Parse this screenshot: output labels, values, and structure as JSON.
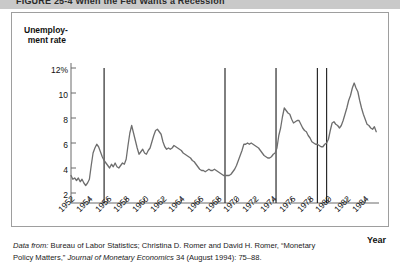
{
  "figure": {
    "title_band_text": "FIGURE 25-4   When the Fed Wants a Recession",
    "source_note_lead": "Data from:",
    "source_note_part1": " Bureau of Labor Statistics; Christina D. Romer and David H. Romer, “Monetary",
    "source_note_part2": "Policy Matters,” ",
    "source_note_journal": "Journal of Monetary Economics",
    "source_note_part3": " 34 (August 1994): 75–88."
  },
  "chart_data": {
    "type": "line",
    "title": "When the Fed Wants a Recession",
    "xlabel": "Year",
    "ylabel_line1": "Unemploy-",
    "ylabel_line2": "ment rate",
    "xlim": [
      1952,
      1985.5
    ],
    "ylim": [
      1.2,
      12.6
    ],
    "grid": false,
    "legend": "none",
    "ytick_labels": [
      "12%",
      "10",
      "8",
      "6",
      "4",
      "2"
    ],
    "ytick_values": [
      12,
      10,
      8,
      6,
      4,
      2
    ],
    "xtick_labels": [
      "1952",
      "1954",
      "1956",
      "1958",
      "1960",
      "1962",
      "1964",
      "1966",
      "1968",
      "1970",
      "1972",
      "1974",
      "1976",
      "1978",
      "1980",
      "1982",
      "1984"
    ],
    "xtick_values": [
      1952,
      1954,
      1956,
      1958,
      1960,
      1962,
      1964,
      1966,
      1968,
      1970,
      1972,
      1974,
      1976,
      1978,
      1980,
      1982,
      1984
    ],
    "line_color": "#6e6e6e",
    "marker_line_color": "#2b2b2b",
    "annotations": [
      {
        "name": "romer-date-1955",
        "x": 1955.6
      },
      {
        "name": "romer-date-1968",
        "x": 1968.75
      },
      {
        "name": "romer-date-1974",
        "x": 1974.3
      },
      {
        "name": "romer-date-1979",
        "x": 1978.8
      },
      {
        "name": "romer-date-1980",
        "x": 1979.8
      }
    ],
    "series": [
      {
        "name": "Unemployment rate",
        "x": [
          1952.0,
          1952.2,
          1952.4,
          1952.6,
          1952.8,
          1953.0,
          1953.2,
          1953.4,
          1953.6,
          1953.8,
          1954.0,
          1954.2,
          1954.4,
          1954.6,
          1954.8,
          1955.0,
          1955.2,
          1955.4,
          1955.6,
          1955.8,
          1956.0,
          1956.2,
          1956.4,
          1956.6,
          1956.8,
          1957.0,
          1957.2,
          1957.4,
          1957.6,
          1957.8,
          1958.0,
          1958.2,
          1958.4,
          1958.6,
          1958.8,
          1959.0,
          1959.2,
          1959.4,
          1959.6,
          1959.8,
          1960.0,
          1960.2,
          1960.4,
          1960.6,
          1960.8,
          1961.0,
          1961.2,
          1961.4,
          1961.6,
          1961.8,
          1962.0,
          1962.2,
          1962.4,
          1962.6,
          1962.8,
          1963.0,
          1963.2,
          1963.4,
          1963.6,
          1963.8,
          1964.0,
          1964.2,
          1964.4,
          1964.6,
          1964.8,
          1965.0,
          1965.2,
          1965.4,
          1965.6,
          1965.8,
          1966.0,
          1966.2,
          1966.4,
          1966.6,
          1966.8,
          1967.0,
          1967.2,
          1967.4,
          1967.6,
          1967.8,
          1968.0,
          1968.2,
          1968.4,
          1968.6,
          1968.8,
          1969.0,
          1969.2,
          1969.4,
          1969.6,
          1969.8,
          1970.0,
          1970.2,
          1970.4,
          1970.6,
          1970.8,
          1971.0,
          1971.2,
          1971.4,
          1971.6,
          1971.8,
          1972.0,
          1972.2,
          1972.4,
          1972.6,
          1972.8,
          1973.0,
          1973.2,
          1973.4,
          1973.6,
          1973.8,
          1974.0,
          1974.2,
          1974.4,
          1974.6,
          1974.8,
          1975.0,
          1975.2,
          1975.4,
          1975.6,
          1975.8,
          1976.0,
          1976.2,
          1976.4,
          1976.6,
          1976.8,
          1977.0,
          1977.2,
          1977.4,
          1977.6,
          1977.8,
          1978.0,
          1978.2,
          1978.4,
          1978.6,
          1978.8,
          1979.0,
          1979.2,
          1979.4,
          1979.6,
          1979.8,
          1980.0,
          1980.2,
          1980.4,
          1980.6,
          1980.8,
          1981.0,
          1981.2,
          1981.4,
          1981.6,
          1981.8,
          1982.0,
          1982.2,
          1982.4,
          1982.6,
          1982.8,
          1983.0,
          1983.2,
          1983.4,
          1983.6,
          1983.8,
          1984.0,
          1984.2,
          1984.4,
          1984.6,
          1984.8,
          1985.0,
          1985.2
        ],
        "values": [
          3.4,
          3.1,
          3.2,
          3.0,
          3.2,
          2.9,
          3.1,
          2.8,
          2.6,
          2.8,
          3.1,
          4.2,
          5.2,
          5.6,
          5.9,
          5.7,
          5.3,
          4.9,
          4.6,
          4.4,
          4.2,
          4.0,
          4.3,
          4.1,
          4.4,
          4.1,
          4.0,
          4.2,
          4.4,
          4.3,
          4.7,
          5.8,
          6.8,
          7.4,
          6.8,
          6.2,
          5.6,
          5.1,
          5.3,
          5.5,
          5.2,
          5.1,
          5.4,
          5.6,
          6.1,
          6.6,
          7.0,
          7.1,
          6.9,
          6.7,
          6.1,
          5.7,
          5.5,
          5.6,
          5.5,
          5.6,
          5.8,
          5.7,
          5.6,
          5.5,
          5.4,
          5.2,
          5.1,
          5.0,
          4.9,
          4.8,
          4.6,
          4.5,
          4.3,
          4.1,
          3.9,
          3.8,
          3.8,
          3.7,
          3.8,
          3.9,
          3.8,
          3.8,
          3.9,
          3.8,
          3.7,
          3.6,
          3.5,
          3.4,
          3.4,
          3.4,
          3.4,
          3.5,
          3.7,
          3.9,
          4.2,
          4.6,
          5.0,
          5.4,
          5.9,
          5.9,
          6.0,
          5.9,
          6.0,
          5.9,
          5.8,
          5.7,
          5.6,
          5.4,
          5.2,
          5.0,
          4.9,
          4.8,
          4.8,
          4.9,
          5.1,
          5.2,
          5.6,
          6.6,
          7.2,
          8.1,
          8.8,
          8.6,
          8.4,
          8.3,
          7.9,
          7.6,
          7.7,
          7.8,
          7.8,
          7.5,
          7.2,
          7.0,
          6.9,
          6.6,
          6.4,
          6.1,
          6.0,
          5.9,
          5.9,
          5.8,
          5.7,
          5.7,
          5.9,
          6.0,
          6.3,
          7.0,
          7.6,
          7.7,
          7.5,
          7.4,
          7.2,
          7.4,
          7.8,
          8.3,
          8.8,
          9.4,
          9.8,
          10.4,
          10.8,
          10.4,
          10.1,
          9.4,
          8.8,
          8.3,
          7.9,
          7.5,
          7.4,
          7.2,
          7.1,
          7.3,
          6.9
        ]
      }
    ]
  }
}
